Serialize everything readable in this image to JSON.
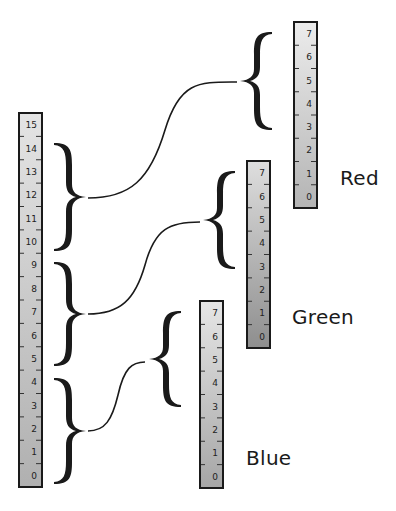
{
  "diagram": {
    "source_scale": {
      "ticks": [
        "15",
        "14",
        "13",
        "12",
        "11",
        "10",
        "9",
        "8",
        "7",
        "6",
        "5",
        "4",
        "3",
        "2",
        "1",
        "0"
      ],
      "range_top": 15,
      "range_bottom": 0
    },
    "groups": [
      {
        "name": "red",
        "source_from": 10,
        "source_to": 14
      },
      {
        "name": "green",
        "source_from": 5,
        "source_to": 9
      },
      {
        "name": "blue",
        "source_from": 0,
        "source_to": 4
      }
    ],
    "channels": [
      {
        "label": "Red",
        "ticks": [
          "7",
          "6",
          "5",
          "4",
          "3",
          "2",
          "1",
          "0"
        ]
      },
      {
        "label": "Green",
        "ticks": [
          "7",
          "6",
          "5",
          "4",
          "3",
          "2",
          "1",
          "0"
        ]
      },
      {
        "label": "Blue",
        "ticks": [
          "7",
          "6",
          "5",
          "4",
          "3",
          "2",
          "1",
          "0"
        ]
      }
    ]
  },
  "colors": {
    "stroke": "#1a1a1a",
    "ruler_light": "#e2e2e2",
    "ruler_dark": "#a8a8a8",
    "green_ruler_dark": "#8f8f8f"
  }
}
